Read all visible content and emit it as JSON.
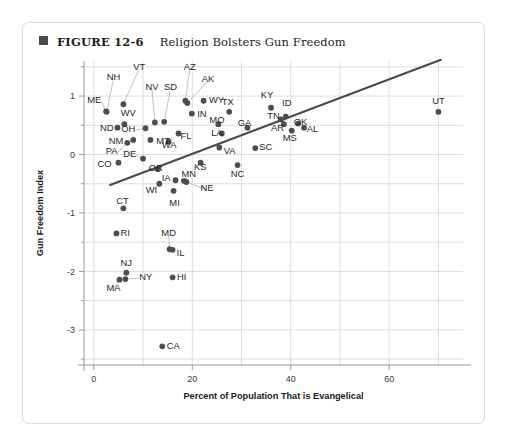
{
  "figure": {
    "bullet_icon": "filled-square-icon",
    "number": "FIGURE 12-6",
    "title": "Religion Bolsters Gun Freedom"
  },
  "chart_data": {
    "type": "scatter",
    "title": "Religion Bolsters Gun Freedom",
    "xlabel": "Percent of Population That is Evangelical",
    "ylabel": "Gun Freedom Index",
    "xlim": [
      -2,
      75
    ],
    "ylim": [
      -3.6,
      1.6
    ],
    "xticks": [
      0,
      20,
      40,
      60
    ],
    "yticks": [
      1,
      0,
      -1,
      -2,
      -3
    ],
    "xticklabels": [
      "0",
      "20",
      "40",
      "60"
    ],
    "yticklabels": [
      "1",
      "0",
      "-1",
      "-2",
      "-3"
    ],
    "grid": true,
    "grid_x_step": 10,
    "grid_y_step": 0.5,
    "legend": "none",
    "point_label_key": "state",
    "trendline": {
      "type": "linear-fit",
      "x_start": 3.3,
      "y_start": -0.52,
      "x_end": 70.5,
      "y_end": 1.62,
      "color": "#4a4a4a"
    },
    "points": [
      {
        "state": "ME",
        "x": 2.5,
        "y": 0.74,
        "lx": 1.5,
        "ly": 0.94,
        "anchor": "end",
        "leader": true
      },
      {
        "state": "NH",
        "x": 2.6,
        "y": 0.73,
        "lx": 4.0,
        "ly": 1.33,
        "anchor": "middle",
        "leader": true
      },
      {
        "state": "VT",
        "x": 6.0,
        "y": 0.86,
        "lx": 9.2,
        "ly": 1.5,
        "anchor": "middle",
        "leader": true
      },
      {
        "state": "WV",
        "x": 6.2,
        "y": 0.52,
        "lx": 7.0,
        "ly": 0.72,
        "anchor": "middle",
        "leader": false
      },
      {
        "state": "ND",
        "x": 4.8,
        "y": 0.46,
        "lx": 4.0,
        "ly": 0.46,
        "anchor": "end",
        "leader": false
      },
      {
        "state": "OH",
        "x": 10.5,
        "y": 0.45,
        "lx": 8.4,
        "ly": 0.45,
        "anchor": "end",
        "leader": true
      },
      {
        "state": "NM",
        "x": 8.0,
        "y": 0.25,
        "lx": 6.0,
        "ly": 0.24,
        "anchor": "end",
        "leader": false
      },
      {
        "state": "MT",
        "x": 11.5,
        "y": 0.25,
        "lx": 12.7,
        "ly": 0.24,
        "anchor": "start",
        "leader": false
      },
      {
        "state": "PA",
        "x": 6.8,
        "y": 0.2,
        "lx": 4.8,
        "ly": 0.07,
        "anchor": "end",
        "leader": true
      },
      {
        "state": "DE",
        "x": 10.0,
        "y": -0.07,
        "lx": 8.6,
        "ly": 0.02,
        "anchor": "end",
        "leader": true
      },
      {
        "state": "CO",
        "x": 5.0,
        "y": -0.14,
        "lx": 3.6,
        "ly": -0.16,
        "anchor": "end",
        "leader": false
      },
      {
        "state": "NV",
        "x": 12.4,
        "y": 0.55,
        "lx": 11.8,
        "ly": 1.17,
        "anchor": "middle",
        "leader": true
      },
      {
        "state": "SD",
        "x": 14.3,
        "y": 0.56,
        "lx": 15.6,
        "ly": 1.17,
        "anchor": "middle",
        "leader": true
      },
      {
        "state": "AZ",
        "x": 18.6,
        "y": 0.92,
        "lx": 19.5,
        "ly": 1.5,
        "anchor": "middle",
        "leader": true
      },
      {
        "state": "AK",
        "x": 19.0,
        "y": 0.88,
        "lx": 23.2,
        "ly": 1.3,
        "anchor": "middle",
        "leader": true
      },
      {
        "state": "WY",
        "x": 22.3,
        "y": 0.92,
        "lx": 23.4,
        "ly": 0.94,
        "anchor": "start",
        "leader": false
      },
      {
        "state": "IN",
        "x": 19.9,
        "y": 0.7,
        "lx": 21.0,
        "ly": 0.7,
        "anchor": "start",
        "leader": false
      },
      {
        "state": "TX",
        "x": 27.5,
        "y": 0.73,
        "lx": 27.2,
        "ly": 0.9,
        "anchor": "middle",
        "leader": false
      },
      {
        "state": "MO",
        "x": 25.3,
        "y": 0.52,
        "lx": 25.0,
        "ly": 0.6,
        "anchor": "middle",
        "leader": false
      },
      {
        "state": "GA",
        "x": 31.2,
        "y": 0.46,
        "lx": 30.6,
        "ly": 0.55,
        "anchor": "middle",
        "leader": false
      },
      {
        "state": "LA",
        "x": 26.0,
        "y": 0.36,
        "lx": 25.0,
        "ly": 0.38,
        "anchor": "middle",
        "leader": false
      },
      {
        "state": "KY",
        "x": 36.0,
        "y": 0.8,
        "lx": 35.2,
        "ly": 1.02,
        "anchor": "middle",
        "leader": false
      },
      {
        "state": "ID",
        "x": 39.0,
        "y": 0.65,
        "lx": 39.2,
        "ly": 0.88,
        "anchor": "middle",
        "leader": false
      },
      {
        "state": "TN",
        "x": 38.0,
        "y": 0.6,
        "lx": 36.5,
        "ly": 0.66,
        "anchor": "middle",
        "leader": false
      },
      {
        "state": "AR",
        "x": 38.6,
        "y": 0.52,
        "lx": 37.3,
        "ly": 0.46,
        "anchor": "middle",
        "leader": false
      },
      {
        "state": "OK",
        "x": 41.5,
        "y": 0.53,
        "lx": 42.0,
        "ly": 0.56,
        "anchor": "middle",
        "leader": false
      },
      {
        "state": "AL",
        "x": 42.7,
        "y": 0.46,
        "lx": 44.4,
        "ly": 0.44,
        "anchor": "middle",
        "leader": false
      },
      {
        "state": "MS",
        "x": 40.2,
        "y": 0.41,
        "lx": 39.8,
        "ly": 0.29,
        "anchor": "middle",
        "leader": false
      },
      {
        "state": "SC",
        "x": 32.8,
        "y": 0.11,
        "lx": 33.6,
        "ly": 0.13,
        "anchor": "start",
        "leader": false
      },
      {
        "state": "UT",
        "x": 70.0,
        "y": 0.73,
        "lx": 70.0,
        "ly": 0.92,
        "anchor": "middle",
        "leader": false
      },
      {
        "state": "FL",
        "x": 17.2,
        "y": 0.36,
        "lx": 17.6,
        "ly": 0.33,
        "anchor": "start",
        "leader": false
      },
      {
        "state": "WA",
        "x": 15.2,
        "y": 0.22,
        "lx": 15.3,
        "ly": 0.17,
        "anchor": "middle",
        "leader": false
      },
      {
        "state": "VA",
        "x": 25.5,
        "y": 0.12,
        "lx": 26.4,
        "ly": 0.07,
        "anchor": "start",
        "leader": false
      },
      {
        "state": "OR",
        "x": 13.0,
        "y": -0.25,
        "lx": 12.6,
        "ly": -0.22,
        "anchor": "middle",
        "leader": false
      },
      {
        "state": "KS",
        "x": 21.7,
        "y": -0.14,
        "lx": 21.6,
        "ly": -0.2,
        "anchor": "middle",
        "leader": false
      },
      {
        "state": "NC",
        "x": 29.2,
        "y": -0.18,
        "lx": 29.2,
        "ly": -0.32,
        "anchor": "middle",
        "leader": false
      },
      {
        "state": "MN",
        "x": 18.3,
        "y": -0.45,
        "lx": 19.3,
        "ly": -0.33,
        "anchor": "middle",
        "leader": true
      },
      {
        "state": "IA",
        "x": 16.6,
        "y": -0.44,
        "lx": 15.6,
        "ly": -0.4,
        "anchor": "end",
        "leader": false
      },
      {
        "state": "NE",
        "x": 18.8,
        "y": -0.47,
        "lx": 23.0,
        "ly": -0.57,
        "anchor": "middle",
        "leader": true
      },
      {
        "state": "WI",
        "x": 13.3,
        "y": -0.5,
        "lx": 11.7,
        "ly": -0.6,
        "anchor": "middle",
        "leader": true
      },
      {
        "state": "MI",
        "x": 16.2,
        "y": -0.62,
        "lx": 16.4,
        "ly": -0.82,
        "anchor": "middle",
        "leader": false
      },
      {
        "state": "CT",
        "x": 6.0,
        "y": -0.92,
        "lx": 5.8,
        "ly": -0.78,
        "anchor": "middle",
        "leader": false
      },
      {
        "state": "RI",
        "x": 4.6,
        "y": -1.35,
        "lx": 5.4,
        "ly": -1.33,
        "anchor": "start",
        "leader": false
      },
      {
        "state": "MD",
        "x": 15.4,
        "y": -1.62,
        "lx": 15.2,
        "ly": -1.34,
        "anchor": "middle",
        "leader": true
      },
      {
        "state": "IL",
        "x": 16.0,
        "y": -1.63,
        "lx": 16.8,
        "ly": -1.67,
        "anchor": "start",
        "leader": false
      },
      {
        "state": "NJ",
        "x": 6.6,
        "y": -2.02,
        "lx": 6.6,
        "ly": -1.85,
        "anchor": "middle",
        "leader": false
      },
      {
        "state": "NY",
        "x": 6.4,
        "y": -2.13,
        "lx": 9.2,
        "ly": -2.08,
        "anchor": "start",
        "leader": true
      },
      {
        "state": "MA",
        "x": 5.2,
        "y": -2.14,
        "lx": 4.0,
        "ly": -2.28,
        "anchor": "middle",
        "leader": true
      },
      {
        "state": "HI",
        "x": 16.0,
        "y": -2.1,
        "lx": 16.9,
        "ly": -2.08,
        "anchor": "start",
        "leader": false
      },
      {
        "state": "CA",
        "x": 13.9,
        "y": -3.28,
        "lx": 14.8,
        "ly": -3.26,
        "anchor": "start",
        "leader": false
      }
    ]
  }
}
